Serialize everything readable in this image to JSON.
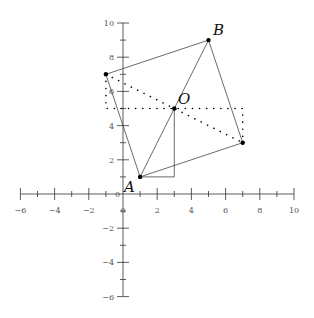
{
  "axes": {
    "x_ticks_labeled": [
      -6,
      -4,
      -2,
      2,
      4,
      6,
      8,
      10
    ],
    "y_ticks_labeled": [
      -6,
      -4,
      -2,
      2,
      4,
      6,
      8,
      10
    ],
    "x_range": [
      -6,
      10
    ],
    "y_range": [
      -6,
      10
    ],
    "origin_labels": [
      "0",
      "0"
    ]
  },
  "points": [
    {
      "name": "A",
      "x": 1,
      "y": 1,
      "label": "A"
    },
    {
      "name": "B",
      "x": 5,
      "y": 9,
      "label": "B"
    },
    {
      "name": "O",
      "x": 3,
      "y": 5,
      "label": "O"
    },
    {
      "name": "P",
      "x": -1,
      "y": 7,
      "label": ""
    },
    {
      "name": "Q",
      "x": 7,
      "y": 3,
      "label": ""
    }
  ],
  "labels": {
    "A": "A",
    "B": "B",
    "O": "O"
  },
  "square": [
    [
      1,
      1
    ],
    [
      7,
      3
    ],
    [
      5,
      9
    ],
    [
      -1,
      7
    ]
  ],
  "colors": {
    "line": "#444444",
    "point": "#000000",
    "axis": "#333333"
  }
}
